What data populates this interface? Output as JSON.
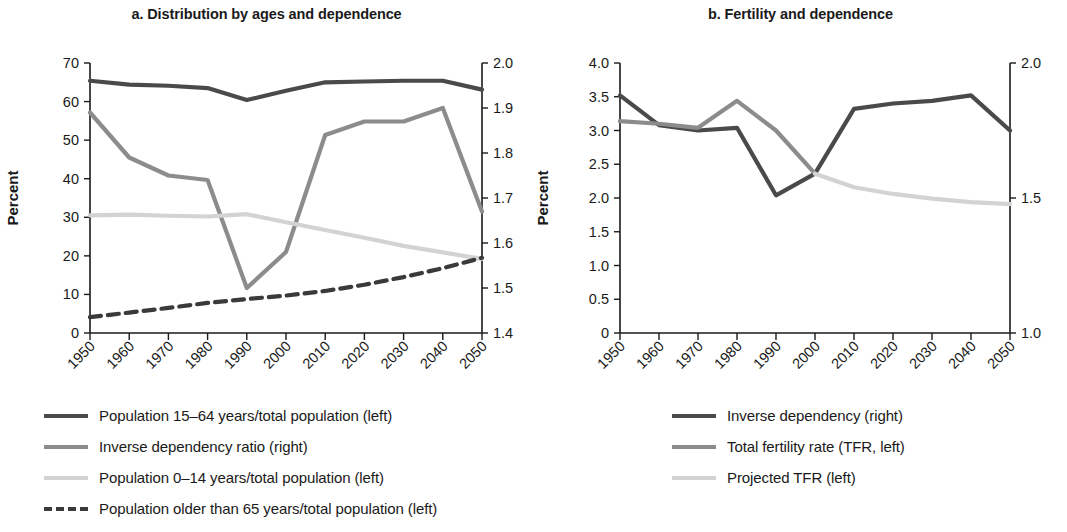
{
  "colors": {
    "dark": "#4a4a4a",
    "medium": "#8c8c8c",
    "light": "#d3d3d3",
    "axis": "#1a1a1a"
  },
  "panel_a": {
    "title": "a. Distribution by ages and dependence",
    "ylabel": "Percent",
    "legend": [
      {
        "label": "Population 15–64 years/total population (left)",
        "color": "#4a4a4a",
        "style": "solid",
        "width": 4
      },
      {
        "label": "Inverse dependency ratio (right)",
        "color": "#8c8c8c",
        "style": "solid",
        "width": 4
      },
      {
        "label": "Population 0–14 years/total population (left)",
        "color": "#d3d3d3",
        "style": "solid",
        "width": 4
      },
      {
        "label": "Population older than 65 years/total population (left)",
        "color": "#3a3a3a",
        "style": "dashed",
        "width": 4
      }
    ]
  },
  "panel_b": {
    "title": "b. Fertility and dependence",
    "ylabel": "Percent",
    "legend": [
      {
        "label": "Inverse dependency (right)",
        "color": "#4a4a4a",
        "style": "solid",
        "width": 4
      },
      {
        "label": "Total fertility rate (TFR, left)",
        "color": "#8c8c8c",
        "style": "solid",
        "width": 4
      },
      {
        "label": "Projected TFR (left)",
        "color": "#d3d3d3",
        "style": "solid",
        "width": 4
      }
    ]
  },
  "chart_data": [
    {
      "type": "line",
      "title": "a. Distribution by ages and dependence",
      "xlabel": "",
      "ylabel": "Percent",
      "y2label": "",
      "x": [
        1950,
        1960,
        1970,
        1980,
        1990,
        2000,
        2010,
        2020,
        2030,
        2040,
        2050
      ],
      "xticklabels": [
        "1950",
        "1960",
        "1970",
        "1980",
        "1990",
        "2000",
        "2010",
        "2020",
        "2030",
        "2040",
        "2050"
      ],
      "ylim": [
        0,
        70
      ],
      "yticks": [
        0,
        10,
        20,
        30,
        40,
        50,
        60,
        70
      ],
      "y2lim": [
        1.4,
        2.0
      ],
      "y2ticks": [
        1.4,
        1.5,
        1.6,
        1.7,
        1.8,
        1.9,
        2.0
      ],
      "grid": false,
      "legend_position": "below",
      "series": [
        {
          "name": "Population 15–64 years/total population (left)",
          "axis": "left",
          "color": "#4a4a4a",
          "style": "solid",
          "values": [
            65.4,
            64.4,
            64.1,
            63.5,
            60.4,
            62.8,
            65.0,
            65.2,
            65.4,
            65.4,
            63.1
          ]
        },
        {
          "name": "Inverse dependency ratio (right)",
          "axis": "right",
          "color": "#8c8c8c",
          "style": "solid",
          "values": [
            55.8,
            45.0,
            40.5,
            39.5,
            13.5,
            21.5,
            49.5,
            52.8,
            52.5,
            56.0,
            32.5
          ],
          "values_right_axis": [
            1.89,
            1.79,
            1.75,
            1.74,
            1.5,
            1.58,
            1.84,
            1.87,
            1.87,
            1.9,
            1.67
          ],
          "note": "plotted on the right (1.4–2.0) axis"
        },
        {
          "name": "Population 0–14 years/total population (left)",
          "axis": "left",
          "color": "#d3d3d3",
          "style": "solid",
          "values": [
            30.5,
            30.7,
            30.4,
            30.2,
            30.8,
            28.7,
            26.7,
            24.7,
            22.6,
            20.9,
            19.2
          ]
        },
        {
          "name": "Population older than 65 years/total population (left)",
          "axis": "left",
          "color": "#3a3a3a",
          "style": "dashed",
          "values": [
            4.1,
            5.3,
            6.5,
            7.8,
            8.8,
            9.7,
            10.9,
            12.5,
            14.5,
            16.8,
            19.5
          ]
        }
      ]
    },
    {
      "type": "line",
      "title": "b. Fertility and dependence",
      "xlabel": "",
      "ylabel": "Percent",
      "y2label": "",
      "x": [
        1950,
        1960,
        1970,
        1980,
        1990,
        2000,
        2010,
        2020,
        2030,
        2040,
        2050
      ],
      "xticklabels": [
        "1950",
        "1960",
        "1970",
        "1980",
        "1990",
        "2000",
        "2010",
        "2020",
        "2030",
        "2040",
        "2050"
      ],
      "ylim": [
        0,
        4.0
      ],
      "yticks": [
        0,
        0.5,
        1.0,
        1.5,
        2.0,
        2.5,
        3.0,
        3.5,
        4.0
      ],
      "y2lim": [
        1.0,
        2.0
      ],
      "y2ticks": [
        1.0,
        1.5,
        2.0
      ],
      "grid": false,
      "legend_position": "below",
      "series": [
        {
          "name": "Inverse dependency (right)",
          "axis": "right",
          "color": "#4a4a4a",
          "style": "solid",
          "values_left_scale": [
            3.52,
            3.08,
            2.98,
            3.02,
            2.06,
            2.35,
            3.32,
            3.4,
            3.42,
            3.5,
            2.99
          ],
          "values": [
            1.88,
            1.77,
            1.75,
            1.76,
            1.51,
            1.59,
            1.83,
            1.85,
            1.86,
            1.88,
            1.75
          ],
          "note": "plotted on the right (1.0–2.0) axis"
        },
        {
          "name": "Total fertility rate (TFR, left)",
          "axis": "left",
          "color": "#8c8c8c",
          "style": "solid",
          "values": [
            3.14,
            3.1,
            3.04,
            3.44,
            3.0,
            2.36,
            null,
            null,
            null,
            null,
            null
          ]
        },
        {
          "name": "Projected TFR (left)",
          "axis": "left",
          "color": "#d3d3d3",
          "style": "solid",
          "values": [
            null,
            null,
            null,
            null,
            null,
            2.36,
            2.16,
            2.06,
            1.99,
            1.94,
            1.91
          ]
        }
      ]
    }
  ]
}
